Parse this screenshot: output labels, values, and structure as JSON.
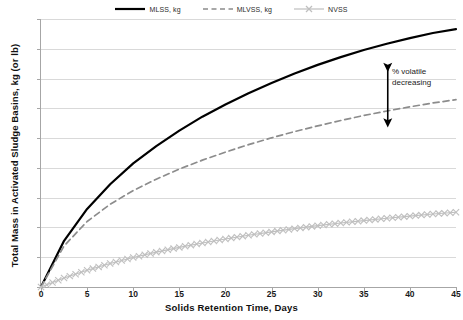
{
  "chart_data": {
    "type": "line",
    "title": "",
    "xlabel": "Solids Retention Time, Days",
    "ylabel": "Total Mass in Activated Sludge Basins, kg (or lb)",
    "xlim": [
      0,
      45
    ],
    "ylim": [
      0,
      9
    ],
    "xticks": [
      0,
      5,
      10,
      15,
      20,
      25,
      30,
      35,
      40,
      45
    ],
    "yticks": [
      0,
      1,
      2,
      3,
      4,
      5,
      6,
      7,
      8,
      9
    ],
    "yticklabels": [
      "",
      "",
      "",
      "",
      "",
      "",
      "",
      "",
      "",
      ""
    ],
    "grid": "horizontal",
    "legend_position": "top-center",
    "x": [
      0,
      2.5,
      5,
      7.5,
      10,
      12.5,
      15,
      17.5,
      20,
      22.5,
      25,
      27.5,
      30,
      32.5,
      35,
      37.5,
      40,
      42.5,
      45
    ],
    "series": [
      {
        "name": "MLSS, kg",
        "color": "#000000",
        "style": "solid",
        "marker": "none",
        "values": [
          0,
          1.55,
          2.62,
          3.45,
          4.15,
          4.73,
          5.25,
          5.72,
          6.13,
          6.51,
          6.85,
          7.17,
          7.46,
          7.72,
          7.96,
          8.17,
          8.36,
          8.53,
          8.66
        ]
      },
      {
        "name": "MLVSS, kg",
        "color": "#8c8c8c",
        "style": "dashed",
        "marker": "none",
        "values": [
          0,
          1.38,
          2.2,
          2.78,
          3.24,
          3.62,
          3.96,
          4.26,
          4.53,
          4.78,
          5.01,
          5.22,
          5.41,
          5.59,
          5.76,
          5.91,
          6.05,
          6.18,
          6.29
        ]
      },
      {
        "name": "NVSS",
        "color": "#bfbfbf",
        "style": "solid",
        "marker": "x",
        "values": [
          0,
          0.3,
          0.56,
          0.79,
          0.99,
          1.17,
          1.33,
          1.48,
          1.61,
          1.74,
          1.85,
          1.96,
          2.06,
          2.15,
          2.23,
          2.31,
          2.38,
          2.45,
          2.51
        ]
      }
    ],
    "annotations": [
      {
        "text_line1": "% volatile",
        "text_line2": "decreasing",
        "arrow": "double-headed-vertical",
        "x": 37.6,
        "y_top": 7.38,
        "y_bottom": 5.52
      }
    ]
  },
  "legend": {
    "items": [
      {
        "label": "MLSS, kg"
      },
      {
        "label": "MLVSS, kg"
      },
      {
        "label": "NVSS"
      }
    ]
  },
  "annotation": {
    "line1": "% volatile",
    "line2": "decreasing"
  },
  "axes": {
    "x_title": "Solids Retention Time, Days",
    "y_title": "Total Mass in Activated Sludge Basins, kg (or lb)",
    "x_tick_labels": [
      "0",
      "5",
      "10",
      "15",
      "20",
      "25",
      "30",
      "35",
      "40",
      "45"
    ]
  }
}
